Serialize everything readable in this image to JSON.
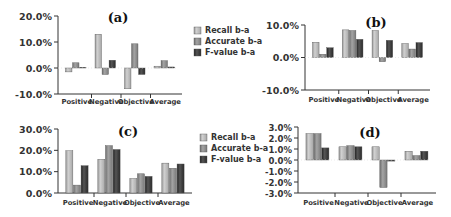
{
  "legend": {
    "items": [
      {
        "label": "Recall b-a",
        "color": "#b4b4b4"
      },
      {
        "label": "Accurate b-a",
        "color": "#8c8c8c"
      },
      {
        "label": "F-value b-a",
        "color": "#3c3c3c"
      }
    ]
  },
  "chart_data": [
    {
      "type": "bar",
      "title": "(a)",
      "categories": [
        "Positive",
        "Negative",
        "Objective",
        "Average"
      ],
      "series": [
        {
          "name": "Recall b-a",
          "values": [
            -1.5,
            13.0,
            -8.0,
            0.7
          ]
        },
        {
          "name": "Accurate b-a",
          "values": [
            2.0,
            -2.5,
            9.3,
            2.8
          ]
        },
        {
          "name": "F-value b-a",
          "values": [
            0.3,
            3.0,
            -2.5,
            0.4
          ]
        }
      ],
      "xlabel": "",
      "ylabel": "",
      "ylim": [
        -10,
        20
      ],
      "yticks": [
        "20.0%",
        "10.0%",
        "0.0%",
        "-10.0%"
      ],
      "yticks_values": [
        20,
        10,
        0,
        -10
      ],
      "legend_position": "right",
      "grid": false
    },
    {
      "type": "bar",
      "title": "(b)",
      "categories": [
        "Positive",
        "Negative",
        "Objective",
        "Average"
      ],
      "series": [
        {
          "name": "Recall b-a",
          "values": [
            4.7,
            8.5,
            8.3,
            4.3
          ]
        },
        {
          "name": "Accurate b-a",
          "values": [
            1.0,
            8.3,
            -1.3,
            2.6
          ]
        },
        {
          "name": "F-value b-a",
          "values": [
            3.0,
            5.6,
            5.3,
            4.6
          ]
        }
      ],
      "xlabel": "",
      "ylabel": "",
      "ylim": [
        -10,
        10
      ],
      "yticks": [
        "10.0%",
        "0.0%",
        "-10.0%"
      ],
      "yticks_values": [
        10,
        0,
        -10
      ],
      "grid": false
    },
    {
      "type": "bar",
      "title": "(c)",
      "categories": [
        "Positive",
        "Negative",
        "Objective",
        "Average"
      ],
      "series": [
        {
          "name": "Recall b-a",
          "values": [
            19.8,
            15.8,
            6.8,
            14.0
          ]
        },
        {
          "name": "Accurate b-a",
          "values": [
            3.7,
            22.2,
            9.0,
            11.6
          ]
        },
        {
          "name": "F-value b-a",
          "values": [
            12.8,
            20.4,
            7.8,
            13.6
          ]
        }
      ],
      "xlabel": "",
      "ylabel": "",
      "ylim": [
        0,
        30
      ],
      "yticks": [
        "30.0%",
        "20.0%",
        "10.0%",
        "0.0%"
      ],
      "yticks_values": [
        30,
        20,
        10,
        0
      ],
      "legend_position": "right",
      "grid": false
    },
    {
      "type": "bar",
      "title": "(d)",
      "categories": [
        "Positive",
        "Negative",
        "Objective",
        "Average"
      ],
      "series": [
        {
          "name": "Recall b-a",
          "values": [
            2.4,
            1.2,
            1.2,
            0.8
          ]
        },
        {
          "name": "Accurate b-a",
          "values": [
            2.4,
            1.3,
            -2.5,
            0.4
          ]
        },
        {
          "name": "F-value b-a",
          "values": [
            1.1,
            1.2,
            -0.1,
            0.8
          ]
        }
      ],
      "xlabel": "",
      "ylabel": "",
      "ylim": [
        -3,
        3
      ],
      "yticks": [
        "3.0%",
        "2.0%",
        "1.0%",
        "0.0%",
        "-1.0%",
        "-2.0%",
        "-3.0%"
      ],
      "yticks_values": [
        3,
        2,
        1,
        0,
        -1,
        -2,
        -3
      ],
      "grid": false
    }
  ],
  "layout": [
    {
      "x0": 58,
      "x1": 182,
      "ytop": 16,
      "ybot": 94,
      "title_x": 118,
      "title_y": 22,
      "tick_font": 9.5,
      "legend": {
        "x": 194,
        "y": 33
      },
      "label_y": 104
    },
    {
      "x0": 305,
      "x1": 430,
      "ytop": 25,
      "ybot": 90,
      "title_x": 376,
      "title_y": 27,
      "tick_font": 9.5,
      "legend": null,
      "label_y": 102
    },
    {
      "x0": 58,
      "x1": 192,
      "ytop": 129,
      "ybot": 193,
      "title_x": 128,
      "title_y": 136,
      "tick_font": 9.5,
      "legend": {
        "x": 200,
        "y": 140
      },
      "label_y": 205
    },
    {
      "x0": 298,
      "x1": 436,
      "ytop": 127,
      "ybot": 193,
      "title_x": 370,
      "title_y": 137,
      "tick_font": 8.5,
      "legend": null,
      "label_y": 205
    }
  ]
}
